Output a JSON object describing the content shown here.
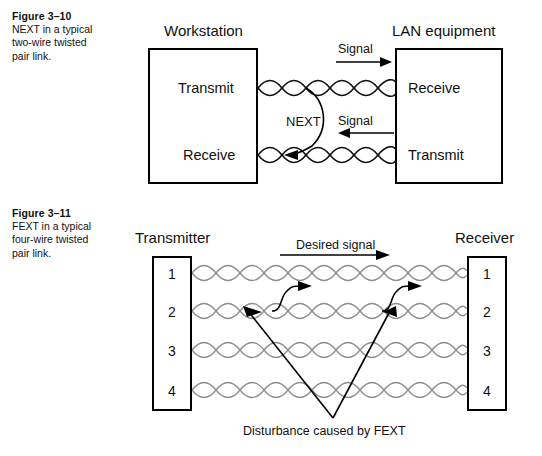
{
  "figures": [
    {
      "number": "Figure 3–10",
      "description": "NEXT in a typical two-wire twisted pair link.",
      "left_box": {
        "heading": "Workstation",
        "ports": [
          "Transmit",
          "Receive"
        ]
      },
      "right_box": {
        "heading": "LAN equipment",
        "ports": [
          "Receive",
          "Transmit"
        ]
      },
      "annotations": {
        "signal_top": "Signal",
        "signal_bottom": "Signal",
        "crosstalk": "NEXT"
      }
    },
    {
      "number": "Figure 3–11",
      "description": "FEXT in a typical four-wire twisted pair link.",
      "left_box": {
        "heading": "Transmitter",
        "pins": [
          "1",
          "2",
          "3",
          "4"
        ]
      },
      "right_box": {
        "heading": "Receiver",
        "pins": [
          "1",
          "2",
          "3",
          "4"
        ]
      },
      "annotations": {
        "desired_signal": "Desired signal",
        "disturbance": "Disturbance caused by FEXT"
      }
    }
  ],
  "colors": {
    "ink": "#111111",
    "wire_grey": "#8c8c8c",
    "page": "#ffffff"
  }
}
